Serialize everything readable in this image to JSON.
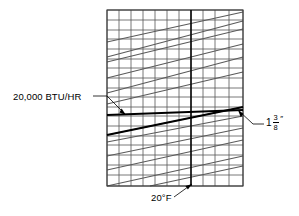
{
  "figure": {
    "type": "nomograph",
    "background": "#ffffff",
    "grid_color": "#555555",
    "curve_color": "#5a5a5a",
    "highlight_color": "#000000"
  },
  "annotations": {
    "load": {
      "name": "load-label",
      "text": "20,000 BTU/HR",
      "leader": "points down-right to left edge of grid at the highlighted horizontal line"
    },
    "temperature": {
      "name": "temperature-label",
      "text": "20°F",
      "leader": "points up-right to the bold vertical grid line"
    },
    "pipe_size": {
      "name": "pipe-size-label",
      "whole": "1",
      "numerator": "3",
      "denominator": "8",
      "unit": "″",
      "text": "1 3/8″",
      "leader": "points up-left to right edge of grid at the highlighted horizontal line"
    }
  },
  "chart_data": {
    "type": "line",
    "title": "",
    "xlabel": "",
    "ylabel": "",
    "grid": true,
    "legend": false,
    "plot_box": {
      "x0": 107,
      "y0": 10,
      "x1": 243,
      "y1": 186
    },
    "x_gridlines": [
      107,
      119,
      131,
      143,
      155,
      167,
      179,
      191,
      203,
      215,
      229,
      243
    ],
    "y_gridlines": [
      10,
      20,
      30,
      39,
      49,
      59,
      68,
      78,
      88,
      97,
      107,
      116,
      126,
      136,
      145,
      155,
      165,
      175,
      186
    ],
    "highlight_vertical": {
      "label": "20°F",
      "x": 191
    },
    "highlight_horizontal": {
      "label": "20,000 BTU/HR",
      "y_left": 115,
      "y_right": 110
    },
    "highlight_diagonal": {
      "label": "1 3/8″",
      "x0": 107,
      "y0": 135,
      "x1": 243,
      "y1": 107
    },
    "series": [
      {
        "name": "curve-1",
        "x": [
          107,
          243
        ],
        "y": [
          42,
          12
        ]
      },
      {
        "name": "curve-2",
        "x": [
          107,
          243
        ],
        "y": [
          57,
          21
        ]
      },
      {
        "name": "curve-3",
        "x": [
          107,
          243
        ],
        "y": [
          62,
          29
        ]
      },
      {
        "name": "curve-4",
        "x": [
          107,
          243
        ],
        "y": [
          78,
          44
        ]
      },
      {
        "name": "curve-5",
        "x": [
          107,
          243
        ],
        "y": [
          93,
          57
        ]
      },
      {
        "name": "curve-6",
        "x": [
          107,
          243
        ],
        "y": [
          104,
          72
        ]
      },
      {
        "name": "curve-7",
        "x": [
          107,
          243
        ],
        "y": [
          135,
          107
        ]
      },
      {
        "name": "curve-8",
        "x": [
          107,
          243
        ],
        "y": [
          142,
          116
        ]
      },
      {
        "name": "curve-9",
        "x": [
          107,
          243
        ],
        "y": [
          156,
          128
        ]
      },
      {
        "name": "curve-10",
        "x": [
          107,
          243
        ],
        "y": [
          170,
          140
        ]
      },
      {
        "name": "curve-11",
        "x": [
          107,
          243
        ],
        "y": [
          186,
          156
        ]
      },
      {
        "name": "curve-12",
        "x": [
          150,
          243
        ],
        "y": [
          186,
          166
        ]
      }
    ]
  }
}
